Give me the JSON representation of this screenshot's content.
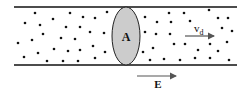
{
  "diagram": {
    "cross_section_label": "A",
    "drift_velocity_label": "v",
    "drift_velocity_subscript": "d",
    "field_label": "E",
    "colors": {
      "line": "#111111",
      "dot": "#111111",
      "cross_section_fill": "#cccccc",
      "arrow": "#555555"
    },
    "tube": {
      "x1": 14,
      "x2": 237,
      "top_y": 7,
      "bottom_y": 65
    },
    "cross_section": {
      "cx": 126,
      "cy": 36,
      "rx": 14,
      "ry": 29
    },
    "drift_arrow": {
      "x1": 185,
      "x2": 215,
      "y": 36
    },
    "field_arrow": {
      "x1": 137,
      "x2": 177,
      "y": 76
    },
    "charges": [
      [
        35,
        13
      ],
      [
        70,
        13
      ],
      [
        107,
        12
      ],
      [
        25,
        23
      ],
      [
        53,
        19
      ],
      [
        83,
        17
      ],
      [
        95,
        18
      ],
      [
        40,
        25
      ],
      [
        66,
        27
      ],
      [
        80,
        27
      ],
      [
        43,
        34
      ],
      [
        90,
        32
      ],
      [
        104,
        33
      ],
      [
        32,
        40
      ],
      [
        61,
        38
      ],
      [
        75,
        39
      ],
      [
        18,
        43
      ],
      [
        93,
        46
      ],
      [
        54,
        49
      ],
      [
        68,
        51
      ],
      [
        80,
        50
      ],
      [
        38,
        53
      ],
      [
        24,
        57
      ],
      [
        105,
        52
      ],
      [
        47,
        61
      ],
      [
        63,
        61
      ],
      [
        78,
        61
      ],
      [
        95,
        58
      ],
      [
        169,
        13
      ],
      [
        184,
        13
      ],
      [
        209,
        10
      ],
      [
        145,
        17
      ],
      [
        157,
        22
      ],
      [
        171,
        22
      ],
      [
        218,
        18
      ],
      [
        228,
        18
      ],
      [
        190,
        21
      ],
      [
        145,
        32
      ],
      [
        156,
        34
      ],
      [
        170,
        34
      ],
      [
        222,
        28
      ],
      [
        232,
        31
      ],
      [
        185,
        44
      ],
      [
        210,
        44
      ],
      [
        174,
        44
      ],
      [
        227,
        42
      ],
      [
        153,
        48
      ],
      [
        143,
        52
      ],
      [
        198,
        50
      ],
      [
        218,
        51
      ],
      [
        150,
        60
      ],
      [
        164,
        59
      ],
      [
        180,
        60
      ],
      [
        195,
        58
      ],
      [
        210,
        58
      ],
      [
        229,
        60
      ]
    ]
  }
}
